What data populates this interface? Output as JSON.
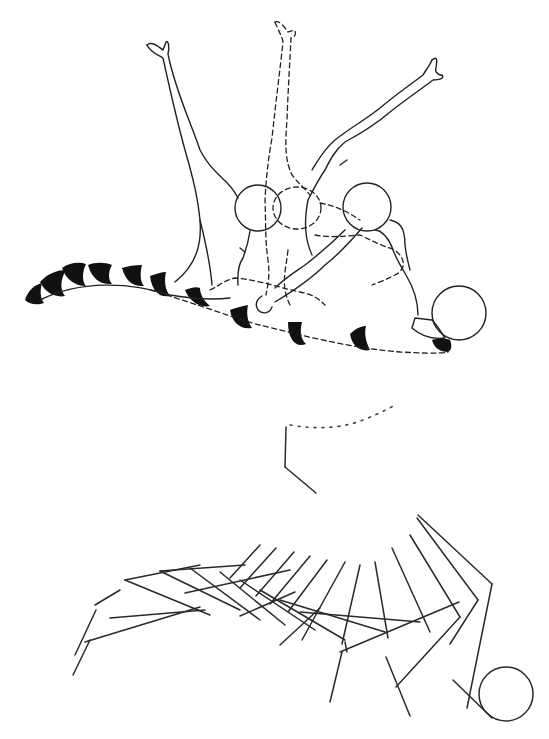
{
  "figure": {
    "colors": {
      "line": "#222222",
      "fill": "#111111",
      "background": "#ffffff"
    },
    "top_panel": {
      "name": "outlined-body-sequence",
      "poses": [
        "left-solid-pose",
        "middle-dashed-pose",
        "right-solid-pose"
      ],
      "ball": {
        "cx": 451,
        "cy": 313,
        "r": 28
      }
    },
    "bottom_panel": {
      "name": "stick-figure-sequence",
      "ball": {
        "cx": 506,
        "cy": 694,
        "r": 28
      }
    }
  }
}
